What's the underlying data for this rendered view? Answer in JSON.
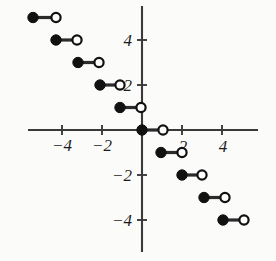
{
  "chart_data": {
    "type": "line",
    "subtype": "step-function",
    "title": "",
    "subtitle": "",
    "xlabel": "",
    "ylabel": "",
    "xlim": [
      -6.2,
      6.7
    ],
    "ylim": [
      -5.8,
      5.8
    ],
    "grid": false,
    "legend": null,
    "annotations": [],
    "x_ticks": [
      -4,
      -2,
      2,
      4
    ],
    "x_tick_labels": [
      "−4",
      "−2",
      "2",
      "4"
    ],
    "y_ticks": [
      4,
      2,
      -2,
      -4
    ],
    "y_tick_labels": [
      "4",
      "2",
      "−2",
      "−4"
    ],
    "steps": [
      {
        "y": 5,
        "x_closed": -5.45,
        "x_open": -4.3,
        "closed_endpoint": "left",
        "open_endpoint": "right"
      },
      {
        "y": 4,
        "x_closed": -4.3,
        "x_open": -3.25,
        "closed_endpoint": "left",
        "open_endpoint": "right"
      },
      {
        "y": 3,
        "x_closed": -3.2,
        "x_open": -2.15,
        "closed_endpoint": "left",
        "open_endpoint": "right"
      },
      {
        "y": 2,
        "x_closed": -2.1,
        "x_open": -1.1,
        "closed_endpoint": "left",
        "open_endpoint": "right"
      },
      {
        "y": 1,
        "x_closed": -1.1,
        "x_open": -0.05,
        "closed_endpoint": "left",
        "open_endpoint": "right"
      },
      {
        "y": 0,
        "x_closed": 0.0,
        "x_open": 1.05,
        "closed_endpoint": "left",
        "open_endpoint": "right"
      },
      {
        "y": -1,
        "x_closed": 0.95,
        "x_open": 2.0,
        "closed_endpoint": "left",
        "open_endpoint": "right"
      },
      {
        "y": -2,
        "x_closed": 2.0,
        "x_open": 3.0,
        "closed_endpoint": "left",
        "open_endpoint": "right"
      },
      {
        "y": -3,
        "x_closed": 3.1,
        "x_open": 4.15,
        "closed_endpoint": "left",
        "open_endpoint": "right"
      },
      {
        "y": -4,
        "x_closed": 4.05,
        "x_open": 5.1,
        "closed_endpoint": "left",
        "open_endpoint": "right"
      }
    ]
  },
  "axes": {
    "x_axis_name": "horizontal-axis",
    "y_axis_name": "vertical-axis"
  },
  "geometry": {
    "origin_px": {
      "x": 142,
      "y": 130
    },
    "unit_px": {
      "x": 20,
      "y": 22.5
    },
    "x_axis_span_px": {
      "x1": 28,
      "x2": 258
    },
    "y_axis_span_px": {
      "y1": 6,
      "y2": 252
    },
    "tick_half_len_px": 5,
    "dot_radius_px": 5.2
  },
  "labels": {
    "x_neg4": "−4",
    "x_neg2": "−2",
    "x_pos2": "2",
    "x_pos4": "4",
    "y_pos4": "4",
    "y_pos2": "2",
    "y_neg2": "−2",
    "y_neg4": "−4"
  }
}
